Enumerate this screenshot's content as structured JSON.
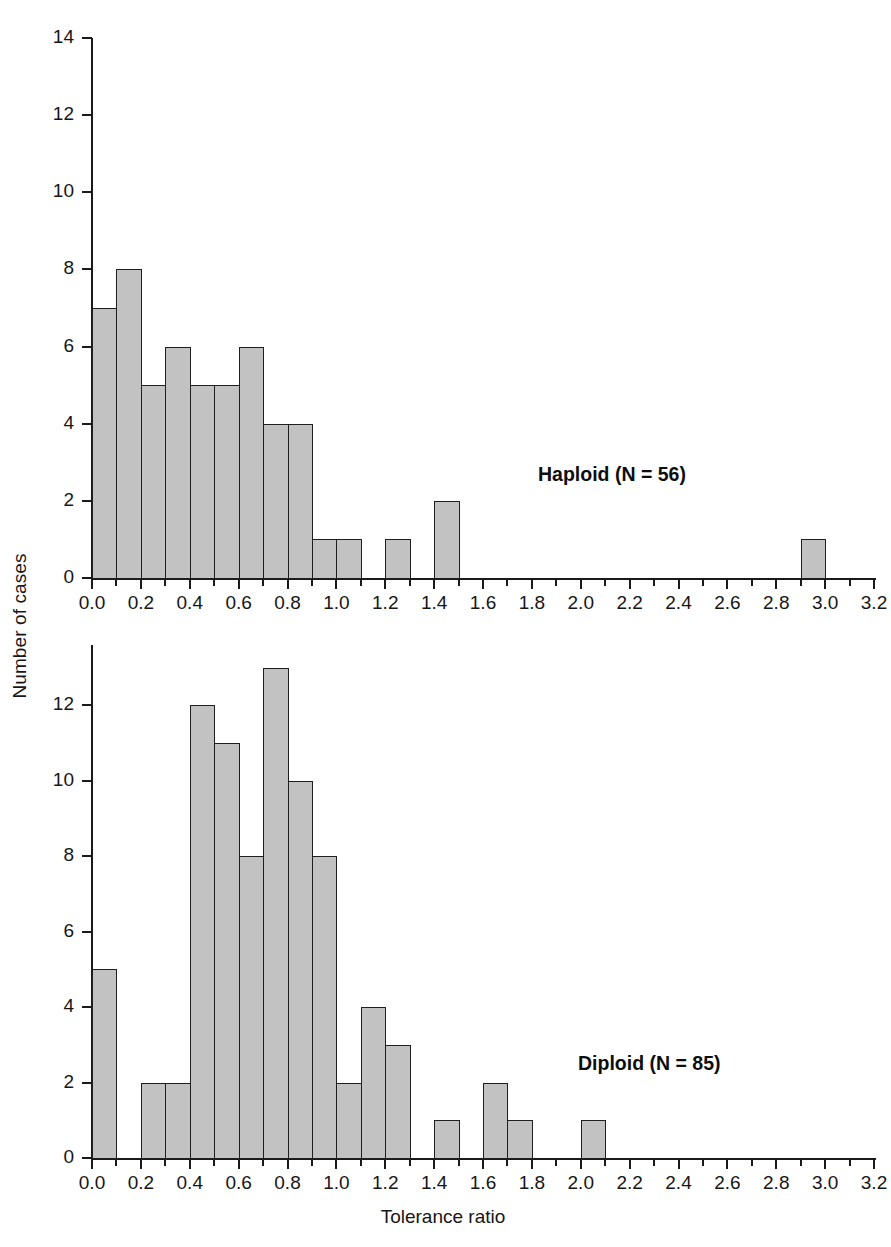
{
  "figure": {
    "xlabel": "Tolerance ratio",
    "ylabel": "Number of cases"
  },
  "chart_data": [
    {
      "type": "bar",
      "title": "Haploid (N = 56)",
      "subtitle": "",
      "xlabel": "Tolerance ratio",
      "ylabel": "Number of cases",
      "xlim": [
        0.0,
        3.2
      ],
      "ylim": [
        0,
        14
      ],
      "bin_width": 0.1,
      "grid": false,
      "legend": "none",
      "annotation": "Haploid (N = 56)",
      "annotation_position": "inside-right",
      "xticks": [
        "0.0",
        "0.2",
        "0.4",
        "0.6",
        "0.8",
        "1.0",
        "1.2",
        "1.4",
        "1.6",
        "1.8",
        "2.0",
        "2.2",
        "2.4",
        "2.6",
        "2.8",
        "3.0",
        "3.2"
      ],
      "xtick_values": [
        0.0,
        0.2,
        0.4,
        0.6,
        0.8,
        1.0,
        1.2,
        1.4,
        1.6,
        1.8,
        2.0,
        2.2,
        2.4,
        2.6,
        2.8,
        3.0,
        3.2
      ],
      "yticks": [
        "0",
        "2",
        "4",
        "6",
        "8",
        "10",
        "12",
        "14"
      ],
      "ytick_values": [
        0,
        2,
        4,
        6,
        8,
        10,
        12,
        14
      ],
      "bins": [
        {
          "lo": 0.0,
          "hi": 0.1,
          "count": 7
        },
        {
          "lo": 0.1,
          "hi": 0.2,
          "count": 8
        },
        {
          "lo": 0.2,
          "hi": 0.3,
          "count": 5
        },
        {
          "lo": 0.3,
          "hi": 0.4,
          "count": 6
        },
        {
          "lo": 0.4,
          "hi": 0.5,
          "count": 5
        },
        {
          "lo": 0.5,
          "hi": 0.6,
          "count": 5
        },
        {
          "lo": 0.6,
          "hi": 0.7,
          "count": 6
        },
        {
          "lo": 0.7,
          "hi": 0.8,
          "count": 4
        },
        {
          "lo": 0.8,
          "hi": 0.9,
          "count": 4
        },
        {
          "lo": 0.9,
          "hi": 1.0,
          "count": 1
        },
        {
          "lo": 1.0,
          "hi": 1.1,
          "count": 1
        },
        {
          "lo": 1.1,
          "hi": 1.2,
          "count": 0
        },
        {
          "lo": 1.2,
          "hi": 1.3,
          "count": 1
        },
        {
          "lo": 1.3,
          "hi": 1.4,
          "count": 0
        },
        {
          "lo": 1.4,
          "hi": 1.5,
          "count": 2
        },
        {
          "lo": 1.5,
          "hi": 2.9,
          "count": 0
        },
        {
          "lo": 2.9,
          "hi": 3.0,
          "count": 1
        }
      ]
    },
    {
      "type": "bar",
      "title": "Diploid (N = 85)",
      "subtitle": "",
      "xlabel": "Tolerance ratio",
      "ylabel": "Number of cases",
      "xlim": [
        0.0,
        3.2
      ],
      "ylim": [
        0,
        13.6
      ],
      "bin_width": 0.1,
      "grid": false,
      "legend": "none",
      "annotation": "Diploid (N = 85)",
      "annotation_position": "inside-right",
      "xticks": [
        "0.0",
        "0.2",
        "0.4",
        "0.6",
        "0.8",
        "1.0",
        "1.2",
        "1.4",
        "1.6",
        "1.8",
        "2.0",
        "2.2",
        "2.4",
        "2.6",
        "2.8",
        "3.0",
        "3.2"
      ],
      "xtick_values": [
        0.0,
        0.2,
        0.4,
        0.6,
        0.8,
        1.0,
        1.2,
        1.4,
        1.6,
        1.8,
        2.0,
        2.2,
        2.4,
        2.6,
        2.8,
        3.0,
        3.2
      ],
      "yticks": [
        "0",
        "2",
        "4",
        "6",
        "8",
        "10",
        "12"
      ],
      "ytick_values": [
        0,
        2,
        4,
        6,
        8,
        10,
        12
      ],
      "bins": [
        {
          "lo": 0.0,
          "hi": 0.1,
          "count": 5
        },
        {
          "lo": 0.1,
          "hi": 0.2,
          "count": 0
        },
        {
          "lo": 0.2,
          "hi": 0.3,
          "count": 2
        },
        {
          "lo": 0.3,
          "hi": 0.4,
          "count": 2
        },
        {
          "lo": 0.4,
          "hi": 0.5,
          "count": 12
        },
        {
          "lo": 0.5,
          "hi": 0.6,
          "count": 11
        },
        {
          "lo": 0.6,
          "hi": 0.7,
          "count": 8
        },
        {
          "lo": 0.7,
          "hi": 0.8,
          "count": 13
        },
        {
          "lo": 0.8,
          "hi": 0.9,
          "count": 10
        },
        {
          "lo": 0.9,
          "hi": 1.0,
          "count": 8
        },
        {
          "lo": 1.0,
          "hi": 1.1,
          "count": 2
        },
        {
          "lo": 1.1,
          "hi": 1.2,
          "count": 4
        },
        {
          "lo": 1.2,
          "hi": 1.3,
          "count": 3
        },
        {
          "lo": 1.3,
          "hi": 1.4,
          "count": 0
        },
        {
          "lo": 1.4,
          "hi": 1.5,
          "count": 1
        },
        {
          "lo": 1.5,
          "hi": 1.6,
          "count": 0
        },
        {
          "lo": 1.6,
          "hi": 1.7,
          "count": 2
        },
        {
          "lo": 1.7,
          "hi": 1.8,
          "count": 1
        },
        {
          "lo": 1.8,
          "hi": 2.0,
          "count": 0
        },
        {
          "lo": 2.0,
          "hi": 2.1,
          "count": 1
        }
      ]
    }
  ],
  "style": {
    "bar_fill": "#c2c2c2",
    "bar_stroke": "#1f1f1f",
    "axis_color": "#1a1a1a",
    "text_color": "#161616",
    "background": "#ffffff"
  }
}
